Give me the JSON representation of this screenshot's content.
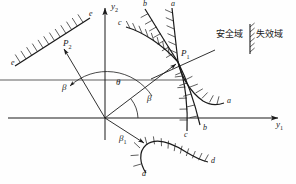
{
  "figure": {
    "background_color": "#fefefe",
    "stroke_color": "#1a1a1a",
    "width": 296,
    "height": 184
  },
  "axes": {
    "origin": {
      "x": 105,
      "y": 118
    },
    "y1": {
      "label": "y",
      "sub": "1",
      "label_x": 276,
      "label_y": 122,
      "tip_x": 281,
      "tip_y": 118
    },
    "y2": {
      "label": "y",
      "sub": "2",
      "label_x": 112,
      "label_y": 4,
      "tip_x": 105,
      "tip_y": 4
    }
  },
  "points": [
    {
      "name": "P1",
      "label": "P",
      "sub": "1",
      "x": 178,
      "y": 62,
      "label_x": 181,
      "label_y": 52
    },
    {
      "name": "P2",
      "label": "P",
      "sub": "2",
      "x": 65,
      "y": 47,
      "label_x": 63,
      "label_y": 42
    }
  ],
  "angles": [
    {
      "name": "theta",
      "label": "θ",
      "label_x": 116,
      "label_y": 83
    },
    {
      "name": "beta-right",
      "label": "β",
      "label_x": 148,
      "label_y": 99
    },
    {
      "name": "beta-left",
      "label": "β",
      "label_x": 63,
      "label_y": 88
    },
    {
      "name": "beta-1",
      "label": "β",
      "sub": "1",
      "label_x": 121,
      "label_y": 139
    }
  ],
  "curve_labels": [
    {
      "name": "curve-a-top",
      "label": "a",
      "x": 171,
      "y": 2
    },
    {
      "name": "curve-a-right",
      "label": "a",
      "x": 227,
      "y": 101
    },
    {
      "name": "curve-b-top",
      "label": "b",
      "x": 143,
      "y": 2
    },
    {
      "name": "curve-b-bottom",
      "label": "b",
      "x": 212,
      "y": 126
    },
    {
      "name": "curve-c-top",
      "label": "c",
      "x": 119,
      "y": 23
    },
    {
      "name": "curve-c-bottom",
      "label": "c",
      "x": 190,
      "y": 133
    },
    {
      "name": "curve-d-left",
      "label": "d",
      "x": 142,
      "y": 172
    },
    {
      "name": "curve-d-right",
      "label": "d",
      "x": 212,
      "y": 160
    },
    {
      "name": "line-e-upper",
      "label": "e",
      "x": 88,
      "y": 14
    },
    {
      "name": "line-e-lower",
      "label": "e",
      "x": 12,
      "y": 62
    }
  ],
  "legend": {
    "safe_label": "安全域",
    "failure_label": "失效域",
    "safe_x": 216,
    "safe_y": 34,
    "failure_x": 257,
    "failure_y": 34,
    "divider_x": 250,
    "divider_top": 24,
    "divider_bottom": 54
  }
}
